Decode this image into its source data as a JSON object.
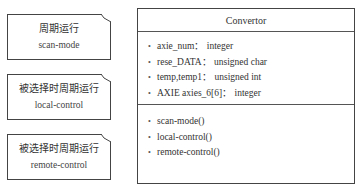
{
  "notes": [
    {
      "title": "周期运行",
      "subtitle": "scan-mode"
    },
    {
      "title": "被选择时周期运行",
      "subtitle": "local-control"
    },
    {
      "title": "被选择时周期运行",
      "subtitle": "remote-control"
    }
  ],
  "class_box": {
    "name": "Convertor",
    "bullet": "•",
    "attributes": [
      "axie_num： integer",
      "rese_DATA： unsigned char",
      "temp,temp1： unsigned int",
      "AXIE axies_6[6]： integer"
    ],
    "methods": [
      "scan-mode()",
      "local-control()",
      "remote-control()"
    ]
  }
}
